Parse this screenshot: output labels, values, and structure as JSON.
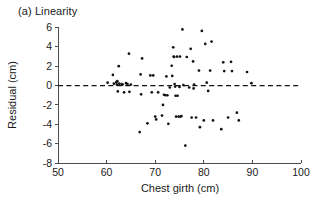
{
  "figure": {
    "panel_label": "(a) Linearity",
    "background_color": "#ffffff",
    "point_color": "#111111",
    "axis_color": "#4d4d4d"
  },
  "chart_data": {
    "type": "scatter",
    "title": "(a) Linearity",
    "xlabel": "Chest girth (cm)",
    "ylabel": "Residual (cm)",
    "xlim": [
      50,
      100
    ],
    "ylim": [
      -8,
      6
    ],
    "xticks": [
      50,
      60,
      70,
      80,
      90,
      100
    ],
    "yticks": [
      6,
      4,
      2,
      0,
      -2,
      -4,
      -6,
      -8
    ],
    "xtick_labels": [
      "50",
      "60",
      "70",
      "80",
      "90",
      "100"
    ],
    "ytick_labels": [
      "6",
      "4",
      "2",
      "0",
      "-2",
      "-4",
      "-6",
      "-8"
    ],
    "grid": false,
    "legend": "none",
    "annotations": [
      {
        "type": "hline",
        "y": 0,
        "style": "dashed",
        "label": "zero residual reference line"
      }
    ],
    "series": [
      {
        "name": "Residuals",
        "marker": "filled circle",
        "points": [
          [
            60.2,
            0.3
          ],
          [
            61.3,
            1.1
          ],
          [
            61.5,
            0.2
          ],
          [
            62.0,
            0.35
          ],
          [
            62.1,
            0.1
          ],
          [
            62.2,
            0.45
          ],
          [
            62.3,
            -0.6
          ],
          [
            62.5,
            2.0
          ],
          [
            62.6,
            0.2
          ],
          [
            63.1,
            0.15
          ],
          [
            63.3,
            0.1
          ],
          [
            63.6,
            -0.7
          ],
          [
            64.0,
            0.25
          ],
          [
            64.3,
            0.15
          ],
          [
            64.6,
            3.3
          ],
          [
            64.7,
            -0.65
          ],
          [
            65.0,
            0.1
          ],
          [
            66.8,
            -4.8
          ],
          [
            67.0,
            1.15
          ],
          [
            67.1,
            -0.9
          ],
          [
            67.3,
            2.8
          ],
          [
            68.4,
            -3.9
          ],
          [
            69.0,
            1.05
          ],
          [
            69.3,
            -0.7
          ],
          [
            69.6,
            1.05
          ],
          [
            70.0,
            -3.2
          ],
          [
            70.2,
            -3.5
          ],
          [
            70.6,
            -0.7
          ],
          [
            71.4,
            -3.1
          ],
          [
            71.6,
            -2.0
          ],
          [
            71.8,
            -0.95
          ],
          [
            72.1,
            -1.0
          ],
          [
            72.3,
            0.95
          ],
          [
            72.5,
            -1.0
          ],
          [
            72.7,
            -3.95
          ],
          [
            73.0,
            -0.2
          ],
          [
            73.4,
            2.05
          ],
          [
            73.5,
            1.0
          ],
          [
            73.7,
            3.95
          ],
          [
            73.8,
            3.0
          ],
          [
            73.9,
            2.95
          ],
          [
            74.0,
            0.15
          ],
          [
            74.1,
            -0.1
          ],
          [
            74.2,
            -1.05
          ],
          [
            74.3,
            -3.2
          ],
          [
            74.5,
            3.0
          ],
          [
            74.6,
            -1.05
          ],
          [
            74.8,
            -3.2
          ],
          [
            75.0,
            -0.15
          ],
          [
            75.1,
            3.0
          ],
          [
            75.2,
            -3.2
          ],
          [
            75.4,
            -3.15
          ],
          [
            75.6,
            5.8
          ],
          [
            75.8,
            0.05
          ],
          [
            76.2,
            -6.2
          ],
          [
            76.5,
            2.95
          ],
          [
            77.0,
            -0.2
          ],
          [
            77.3,
            3.8
          ],
          [
            77.5,
            -3.3
          ],
          [
            77.8,
            2.5
          ],
          [
            77.9,
            -0.3
          ],
          [
            78.0,
            0.1
          ],
          [
            78.4,
            -3.3
          ],
          [
            79.0,
            1.55
          ],
          [
            79.2,
            -4.3
          ],
          [
            79.6,
            5.65
          ],
          [
            80.0,
            -3.6
          ],
          [
            80.3,
            4.3
          ],
          [
            80.6,
            0.3
          ],
          [
            80.9,
            -0.55
          ],
          [
            81.3,
            1.55
          ],
          [
            81.6,
            4.55
          ],
          [
            81.9,
            -3.6
          ],
          [
            83.6,
            -4.5
          ],
          [
            84.0,
            2.4
          ],
          [
            84.2,
            1.5
          ],
          [
            85.0,
            -3.3
          ],
          [
            85.6,
            2.45
          ],
          [
            85.8,
            1.5
          ],
          [
            86.8,
            -2.8
          ],
          [
            87.2,
            -3.6
          ],
          [
            88.9,
            1.4
          ],
          [
            89.8,
            0.25
          ]
        ]
      }
    ]
  }
}
